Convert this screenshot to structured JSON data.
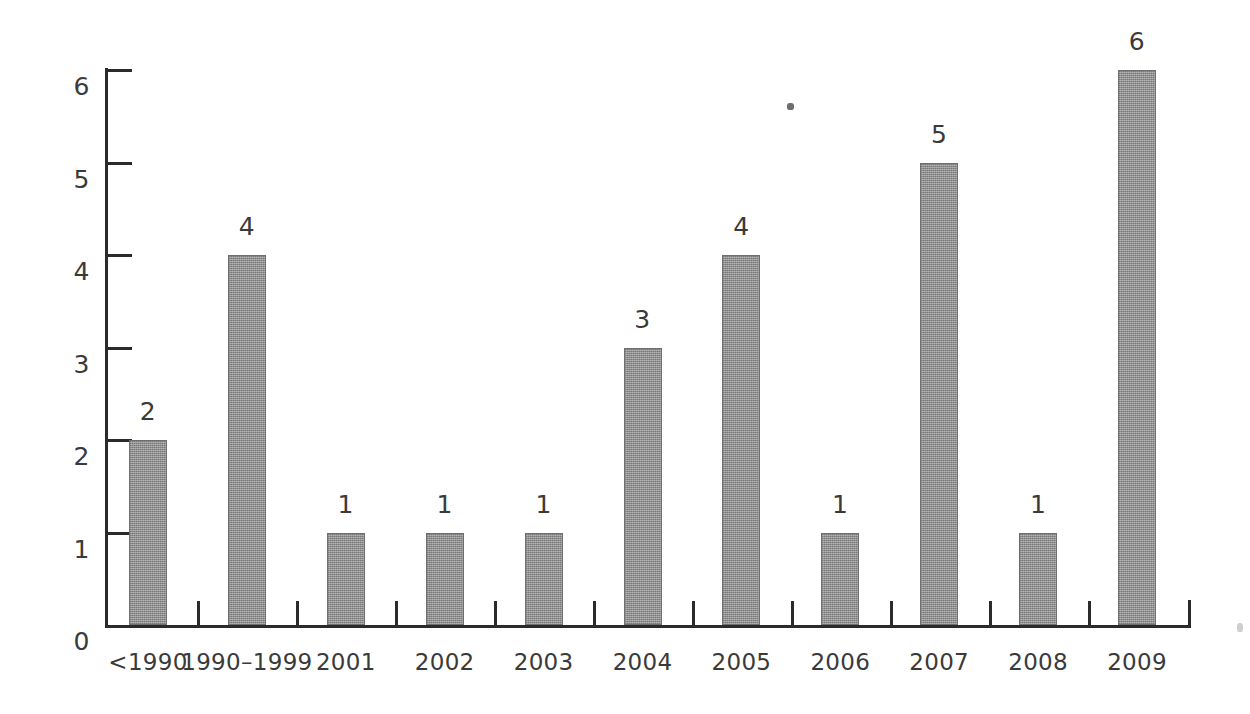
{
  "chart_data": {
    "type": "bar",
    "title": "",
    "subtitle": "",
    "xlabel": "",
    "ylabel": "",
    "categories": [
      "<1990",
      "1990–1999",
      "2001",
      "2002",
      "2003",
      "2004",
      "2005",
      "2006",
      "2007",
      "2008",
      "2009"
    ],
    "values": [
      2,
      4,
      1,
      1,
      1,
      3,
      4,
      1,
      5,
      1,
      6
    ],
    "value_labels": [
      "2",
      "4",
      "1",
      "1",
      "1",
      "3",
      "4",
      "1",
      "5",
      "1",
      "6"
    ],
    "ylim": [
      0,
      6
    ],
    "ytick_values": [
      0,
      1,
      2,
      3,
      4,
      5,
      6
    ],
    "ytick_labels": [
      "0",
      "1",
      "2",
      "3",
      "4",
      "5",
      "6"
    ],
    "grid": false,
    "legend": null,
    "legend_position": "none",
    "bar_color": "#8f8f8f",
    "bar_edge_color": "#6f6f6f",
    "axis_color": "#2b2b2b",
    "text_color": "#3a3a3a",
    "background_color": "#ffffff",
    "annotations": []
  }
}
